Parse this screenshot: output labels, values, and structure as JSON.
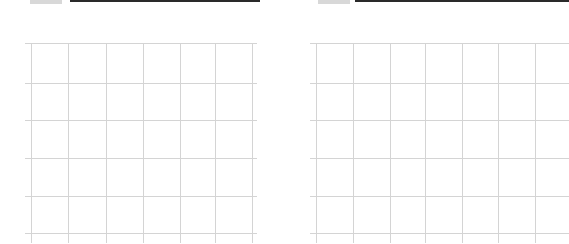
{
  "worksheet": {
    "panels": [
      {
        "id": "left",
        "header": {
          "mark_x": 30,
          "mark_w": 32,
          "bar_x": 70,
          "bar_w": 190
        },
        "grid": {
          "x": 25,
          "width": 232,
          "height": 200,
          "cols": [
            6,
            68,
            106,
            143,
            180,
            215,
            252
          ],
          "rows": [
            0,
            40,
            77,
            115,
            153,
            190
          ]
        }
      },
      {
        "id": "right",
        "header": {
          "mark_x": 318,
          "mark_w": 32,
          "bar_x": 355,
          "bar_w": 214
        },
        "grid": {
          "x": 310,
          "width": 259,
          "height": 200,
          "cols": [
            6,
            43,
            80,
            115,
            152,
            188,
            225
          ],
          "rows": [
            0,
            40,
            77,
            115,
            153,
            190
          ]
        }
      }
    ],
    "colors": {
      "grid_line": "#d4d4d4",
      "header_bar": "#2a2a2a",
      "background": "#ffffff"
    }
  }
}
